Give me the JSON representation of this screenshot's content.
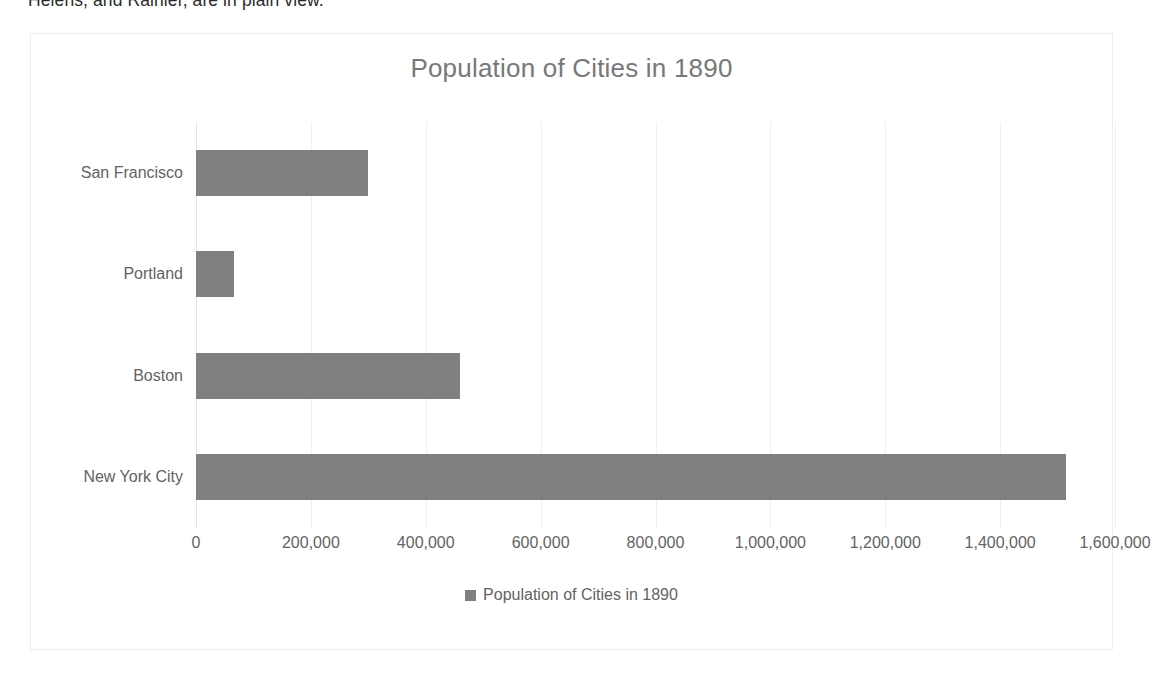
{
  "document": {
    "clipped_line": "Helens, and Rainier, are in plain view."
  },
  "chart_data": {
    "type": "bar",
    "orientation": "horizontal",
    "title": "Population of Cities in 1890",
    "xlabel": "",
    "ylabel": "",
    "categories": [
      "San Francisco",
      "Portland",
      "Boston",
      "New York City"
    ],
    "values": [
      300000,
      66000,
      460000,
      1515000
    ],
    "xlim": [
      0,
      1600000
    ],
    "xticks": [
      0,
      200000,
      400000,
      600000,
      800000,
      1000000,
      1200000,
      1400000,
      1600000
    ],
    "xtick_labels": [
      "0",
      "200,000",
      "400,000",
      "600,000",
      "800,000",
      "1,000,000",
      "1,200,000",
      "1,400,000",
      "1,600,000"
    ],
    "grid": true,
    "grid_axis": "x",
    "legend": {
      "position": "bottom",
      "entries": [
        {
          "label": "Population of Cities in 1890",
          "color": "#808080",
          "marker": "square"
        }
      ]
    },
    "colors": {
      "bar": "#808080",
      "text": "#636363",
      "title": "#787878",
      "gridline": "#f0f0f0",
      "frame_border": "#eeeeee",
      "background": "#ffffff"
    }
  }
}
